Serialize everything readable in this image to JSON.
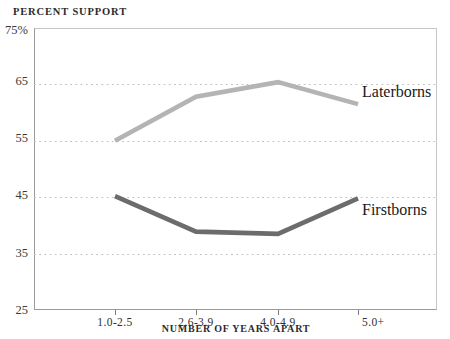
{
  "chart_data": {
    "type": "line",
    "title": "PERCENT SUPPORT",
    "xlabel": "NUMBER OF YEARS APART",
    "ylabel": "PERCENT SUPPORT",
    "categories": [
      "1.0-2.5",
      "2.6-3.9",
      "4.0-4.9",
      "5.0+"
    ],
    "ylim": [
      25,
      75
    ],
    "yticks": [
      25,
      35,
      45,
      55,
      65,
      75
    ],
    "ytick_labels": [
      "25",
      "35",
      "45",
      "55",
      "65",
      "75%"
    ],
    "grid": "horizontal-dotted",
    "legend_position": "inline-right",
    "series": [
      {
        "name": "Laterborns",
        "color": "#b4b4b4",
        "values": [
          55.0,
          62.8,
          65.4,
          61.5
        ]
      },
      {
        "name": "Firstborns",
        "color": "#6c6c6c",
        "values": [
          45.2,
          38.9,
          38.5,
          44.8
        ]
      }
    ]
  },
  "axis": {
    "y_tick_labels": [
      "75%",
      "65",
      "55",
      "45",
      "35",
      "25"
    ],
    "x_tick_labels": [
      "1.0-2.5",
      "2.6-3.9",
      "4.0-4.9",
      "5.0+"
    ]
  },
  "labels": {
    "chart_title": "PERCENT SUPPORT",
    "x_axis_title": "NUMBER OF YEARS APART",
    "series_laterborns": "Laterborns",
    "series_firstborns": "Firstborns"
  },
  "colors": {
    "laterborns_line": "#b4b4b4",
    "firstborns_line": "#6c6c6c",
    "gridline": "#bfbfbf",
    "axis": "#9a9a9a",
    "text": "#2b2b2b"
  }
}
